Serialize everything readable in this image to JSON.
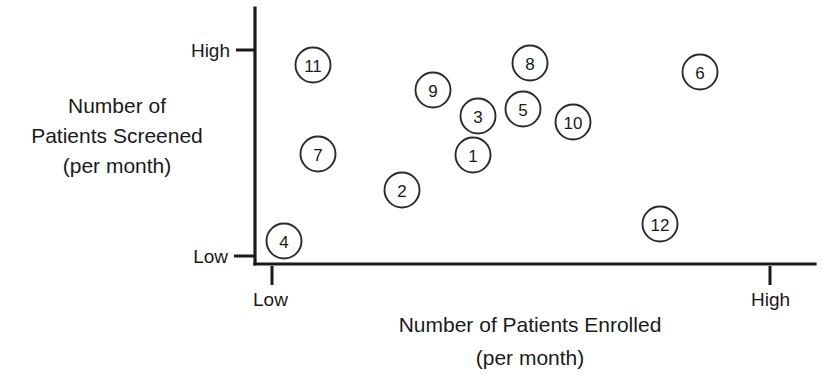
{
  "chart_data": {
    "type": "scatter",
    "title": "",
    "xlabel_line1": "Number of Patients Enrolled",
    "xlabel_line2": "(per month)",
    "ylabel_line1": "Number of",
    "ylabel_line2": "Patients Screened",
    "ylabel_line3": "(per month)",
    "x_tick_labels": [
      "Low",
      "High"
    ],
    "y_tick_labels": [
      "Low",
      "High"
    ],
    "xlim_labels": [
      "Low",
      "High"
    ],
    "ylim_labels": [
      "Low",
      "High"
    ],
    "grid": false,
    "legend": "none",
    "axis_color": "#1a1a1a",
    "marker_fill": "#ffffff",
    "marker_stroke": "#2b2b2b",
    "note": "Qualitative two-by-two style scatter; axes are ordinal Low-to-High with no numeric scale. Point coordinates below are normalized 0-1 estimates read off the plotting area.",
    "points": [
      {
        "label": "1",
        "x": 0.39,
        "y": 0.52
      },
      {
        "label": "2",
        "x": 0.26,
        "y": 0.35
      },
      {
        "label": "3",
        "x": 0.4,
        "y": 0.71
      },
      {
        "label": "4",
        "x": 0.05,
        "y": 0.09
      },
      {
        "label": "5",
        "x": 0.48,
        "y": 0.74
      },
      {
        "label": "6",
        "x": 0.8,
        "y": 0.92
      },
      {
        "label": "7",
        "x": 0.11,
        "y": 0.52
      },
      {
        "label": "8",
        "x": 0.49,
        "y": 0.96
      },
      {
        "label": "9",
        "x": 0.32,
        "y": 0.84
      },
      {
        "label": "10",
        "x": 0.57,
        "y": 0.68
      },
      {
        "label": "12",
        "x": 0.73,
        "y": 0.18
      },
      {
        "label": "11",
        "x": 0.1,
        "y": 0.94
      }
    ]
  },
  "geometry": {
    "axis_x": 255,
    "axis_top": 8,
    "axis_bottom": 264,
    "axis_right": 815,
    "y_high_tick": 50,
    "y_low_tick": 256,
    "x_low_tick": 272,
    "x_high_tick": 770,
    "marker_radius": 17.5,
    "pixel_points": [
      {
        "label": "11",
        "cx": 313,
        "cy": 65
      },
      {
        "label": "8",
        "cx": 530,
        "cy": 63
      },
      {
        "label": "6",
        "cx": 700,
        "cy": 72
      },
      {
        "label": "9",
        "cx": 433,
        "cy": 90
      },
      {
        "label": "5",
        "cx": 523,
        "cy": 109
      },
      {
        "label": "3",
        "cx": 478,
        "cy": 116
      },
      {
        "label": "10",
        "cx": 573,
        "cy": 122
      },
      {
        "label": "1",
        "cx": 473,
        "cy": 155
      },
      {
        "label": "7",
        "cx": 318,
        "cy": 154
      },
      {
        "label": "2",
        "cx": 402,
        "cy": 190
      },
      {
        "label": "12",
        "cx": 660,
        "cy": 224
      },
      {
        "label": "4",
        "cx": 284,
        "cy": 241
      }
    ]
  }
}
